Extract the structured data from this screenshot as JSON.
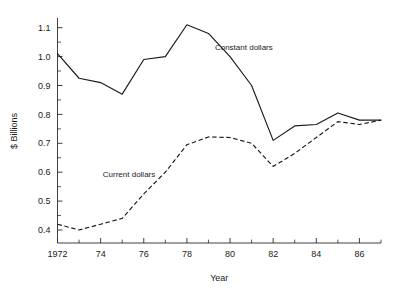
{
  "chart_data": {
    "type": "line",
    "title": "",
    "xlabel": "Year",
    "ylabel": "$ Billions",
    "x": [
      1972,
      1973,
      1974,
      1975,
      1976,
      1977,
      1978,
      1979,
      1980,
      1981,
      1982,
      1983,
      1984,
      1985,
      1986,
      1987
    ],
    "xlim": [
      1972,
      1987
    ],
    "ylim": [
      0.355,
      1.13
    ],
    "grid": false,
    "legend_position": "inline-annotations",
    "x_tick_labels": [
      "1972",
      "",
      "74",
      "",
      "76",
      "",
      "78",
      "",
      "80",
      "",
      "82",
      "",
      "84",
      "",
      "86",
      ""
    ],
    "x_major_ticks": [
      1972,
      1974,
      1976,
      1978,
      1980,
      1982,
      1984,
      1986
    ],
    "x_minor_ticks": [
      1973,
      1975,
      1977,
      1979,
      1981,
      1983,
      1985,
      1987
    ],
    "y_tick_labels": [
      "0.4",
      "0.5",
      "0.6",
      "0.7",
      "0.8",
      "0.9",
      "1.0",
      "1.1"
    ],
    "y_major_ticks": [
      0.4,
      0.5,
      0.6,
      0.7,
      0.8,
      0.9,
      1.0,
      1.1
    ],
    "y_minor_ticks": [
      0.45,
      0.55,
      0.65,
      0.75,
      0.85,
      0.95,
      1.05
    ],
    "series": [
      {
        "name": "Constant dollars",
        "style": "solid",
        "color": "#1a1a1a",
        "label_x": 1979.3,
        "label_y": 1.022,
        "values": [
          1.01,
          0.925,
          0.91,
          0.87,
          0.99,
          1.0,
          1.11,
          1.08,
          1.0,
          0.9,
          0.71,
          0.76,
          0.765,
          0.805,
          0.78,
          0.78
        ]
      },
      {
        "name": "Current dollars",
        "style": "dashed",
        "color": "#1a1a1a",
        "label_x": 1974.1,
        "label_y": 0.585,
        "values": [
          0.42,
          0.4,
          0.42,
          0.44,
          0.525,
          0.6,
          0.695,
          0.722,
          0.72,
          0.7,
          0.62,
          0.665,
          0.72,
          0.775,
          0.765,
          0.78
        ]
      }
    ]
  },
  "axes": {
    "x_axis_title": "Year",
    "y_axis_title": "$ Billions"
  },
  "annotations": {
    "constant_label": "Constant dollars",
    "current_label": "Current dollars"
  }
}
